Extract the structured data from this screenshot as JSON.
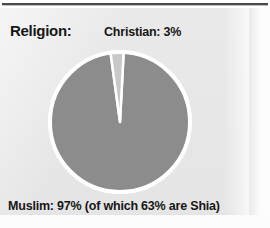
{
  "figure": {
    "title_label": "Religion:",
    "background_color": "#e9e9e9",
    "rule_color": "#4a4a4a"
  },
  "labels": {
    "christian": "Christian: 3%",
    "muslim": "Muslim: 97% (of which 63% are Shia)"
  },
  "chart_data": {
    "type": "pie",
    "title": "Religion:",
    "subtitle": "",
    "xlabel": "",
    "ylabel": "",
    "grid": false,
    "legend_position": "none",
    "units": "percent",
    "categories": [
      "Muslim",
      "Christian"
    ],
    "values": [
      97,
      3
    ],
    "slices": [
      {
        "label": "Muslim",
        "value": 97,
        "value_text": "97%",
        "annotation": "Muslim: 97% (of which 63% are Shia)",
        "annotation_position": "below-chart-left",
        "color": "#8c8c8c",
        "start_angle_deg": 9,
        "end_angle_deg": 358
      },
      {
        "label": "Christian",
        "value": 3,
        "value_text": "3%",
        "annotation": "Christian: 3%",
        "annotation_position": "above-chart-right",
        "color": "#c8c8c8",
        "start_angle_deg": 358,
        "end_angle_deg": 369
      }
    ],
    "sub_breakdown": {
      "parent": "Muslim",
      "label": "Shia",
      "value": 63,
      "value_text": "63%",
      "note": "of which 63% are Shia"
    },
    "geometry": {
      "center_x": 76,
      "center_y": 76,
      "radius": 70,
      "separator_color": "#ffffff",
      "outline_color": "#ffffff"
    }
  }
}
